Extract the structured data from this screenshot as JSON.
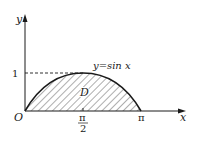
{
  "diagram": {
    "type": "function-region",
    "axes": {
      "x_label": "x",
      "y_label": "y",
      "origin_label": "O"
    },
    "ticks": {
      "y_one": "1",
      "x_half_pi_num": "π",
      "x_half_pi_den": "2",
      "x_pi": "π"
    },
    "curve_label": "y=sin x",
    "region_label": "D",
    "colors": {
      "ink": "#1a1a1a",
      "background": "#ffffff"
    }
  }
}
